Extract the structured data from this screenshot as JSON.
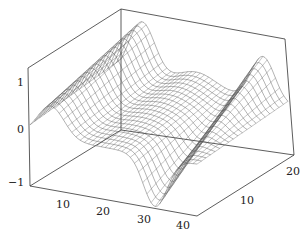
{
  "chart_data": {
    "type": "surface-mesh",
    "title": "",
    "xlabel": "",
    "ylabel": "",
    "zlabel": "",
    "x_range": [
      0,
      40
    ],
    "y_range": [
      0,
      20
    ],
    "z_range": [
      -1.3,
      1.3
    ],
    "x_ticks": [
      "10",
      "20",
      "30",
      "40"
    ],
    "y_ticks": [
      "10",
      "20"
    ],
    "z_ticks": [
      "−1",
      "0",
      "1"
    ],
    "grid": false,
    "legend": null,
    "style": "waterfall mesh lines, gray, box axes"
  },
  "axes": {
    "z_labels": [
      {
        "text": "1",
        "x": 17,
        "y": 86
      },
      {
        "text": "0",
        "x": 17,
        "y": 133
      },
      {
        "text": "−1",
        "x": 8,
        "y": 186
      }
    ],
    "x_labels": [
      {
        "text": "10",
        "x": 56,
        "y": 208
      },
      {
        "text": "20",
        "x": 96,
        "y": 215
      },
      {
        "text": "30",
        "x": 137,
        "y": 223
      },
      {
        "text": "40",
        "x": 176,
        "y": 229
      }
    ],
    "y_labels": [
      {
        "text": "10",
        "x": 240,
        "y": 204
      },
      {
        "text": "20",
        "x": 286,
        "y": 175
      }
    ]
  },
  "colors": {
    "axis": "#333333",
    "mesh": "#555555"
  }
}
